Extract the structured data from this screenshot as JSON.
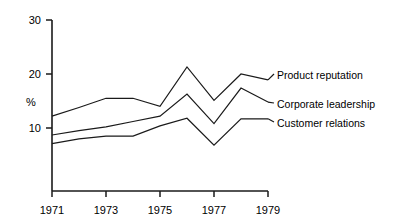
{
  "chart_data": {
    "type": "line",
    "title": "",
    "subtitle": "",
    "xlabel": "",
    "ylabel": "%",
    "x": [
      1971,
      1972,
      1973,
      1974,
      1975,
      1976,
      1977,
      1978,
      1979
    ],
    "xtick_labels": [
      "1971",
      "1973",
      "1975",
      "1977",
      "1979"
    ],
    "xticks": [
      1971,
      1973,
      1975,
      1977,
      1979
    ],
    "xlim": [
      1971,
      1979
    ],
    "ytick_labels": [
      "10",
      "20",
      "30"
    ],
    "yticks": [
      10,
      20,
      30
    ],
    "ylim": [
      0,
      30
    ],
    "grid": false,
    "legend_position": "right-inline-labels",
    "series": [
      {
        "name": "Product reputation",
        "values": [
          12.2,
          13.8,
          15.5,
          15.5,
          14.0,
          21.3,
          15.1,
          20.0,
          18.9
        ],
        "color": "#1a1a1a"
      },
      {
        "name": "Corporate leadership",
        "values": [
          8.7,
          9.5,
          10.2,
          11.2,
          12.2,
          16.3,
          10.8,
          17.4,
          14.8
        ],
        "color": "#1a1a1a"
      },
      {
        "name": "Customer relations",
        "values": [
          7.1,
          8.0,
          8.5,
          8.5,
          10.4,
          11.8,
          6.8,
          11.7,
          11.7
        ],
        "color": "#1a1a1a"
      }
    ]
  },
  "axis": {
    "y_label": "%",
    "y_tick_30": "30",
    "y_tick_20": "20",
    "y_tick_10": "10",
    "x_tick_1971": "1971",
    "x_tick_1973": "1973",
    "x_tick_1975": "1975",
    "x_tick_1977": "1977",
    "x_tick_1979": "1979"
  },
  "legend": {
    "items": [
      {
        "label": "Product reputation"
      },
      {
        "label": "Corporate leadership"
      },
      {
        "label": "Customer relations"
      }
    ]
  },
  "colors": {
    "line": "#1a1a1a",
    "axis": "#1a1a1a",
    "text": "#000000",
    "background": "#ffffff"
  }
}
